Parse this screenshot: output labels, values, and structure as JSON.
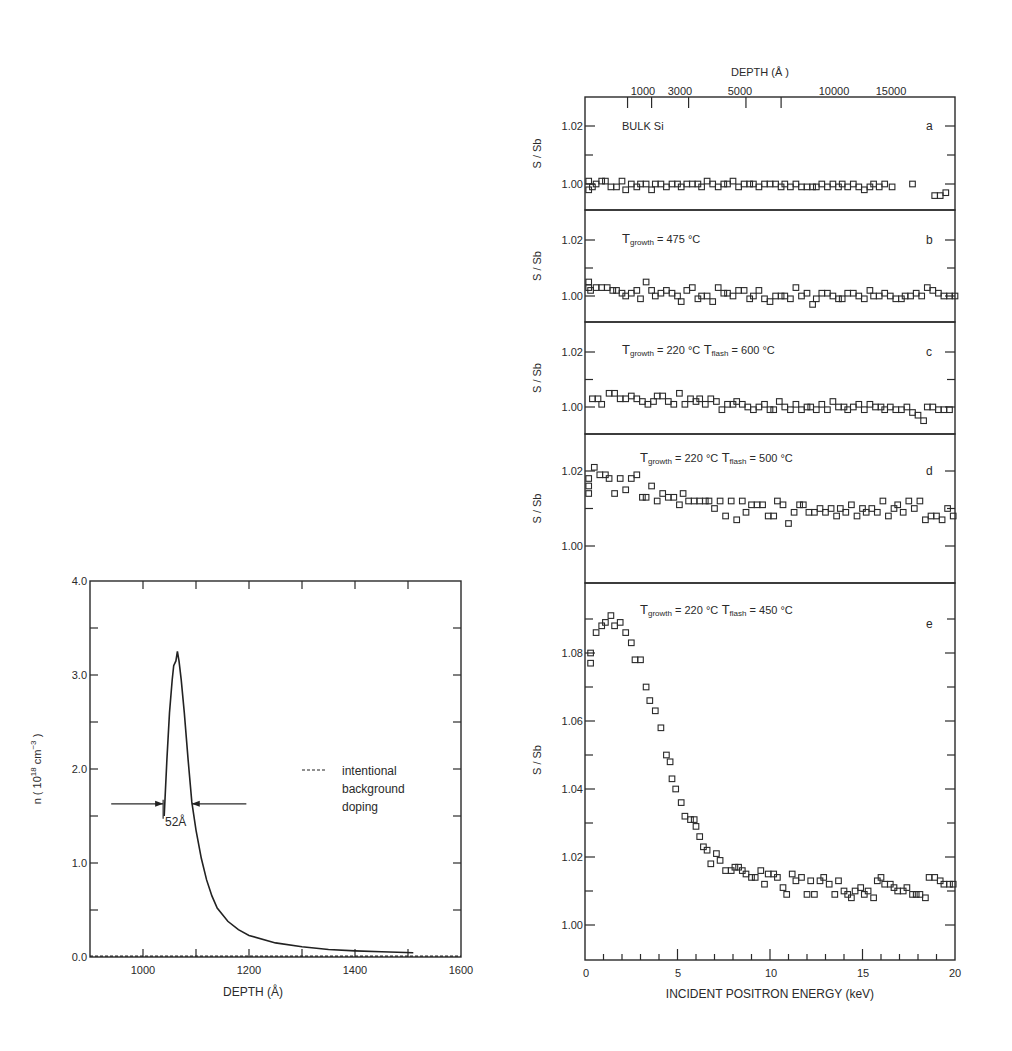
{
  "chart_data": [
    {
      "id": "left",
      "type": "line",
      "title": "",
      "xlabel": "DEPTH (Å)",
      "ylabel": "n ( 10^18 cm^-3 )",
      "xlim": [
        900,
        1600
      ],
      "ylim": [
        0.0,
        4.0
      ],
      "xticks": [
        1000,
        1200,
        1400,
        1600
      ],
      "yticks": [
        "0.0",
        "1.0",
        "2.0",
        "3.0",
        "4.0"
      ],
      "series": [
        {
          "name": "dopant profile",
          "style": "solid",
          "x": [
            1040,
            1045,
            1050,
            1055,
            1058,
            1062,
            1065,
            1068,
            1072,
            1078,
            1085,
            1092,
            1100,
            1110,
            1120,
            1130,
            1140,
            1160,
            1180,
            1200,
            1250,
            1300,
            1350,
            1400,
            1450,
            1510
          ],
          "y": [
            1.5,
            2.1,
            2.6,
            2.95,
            3.1,
            3.15,
            3.25,
            3.15,
            2.95,
            2.6,
            2.1,
            1.65,
            1.35,
            1.05,
            0.82,
            0.65,
            0.52,
            0.38,
            0.29,
            0.23,
            0.15,
            0.11,
            0.08,
            0.065,
            0.055,
            0.045
          ]
        },
        {
          "name": "intentional background doping",
          "style": "dashed",
          "x": [
            900,
            1600
          ],
          "y": [
            0.01,
            0.01
          ]
        }
      ],
      "annotations": {
        "fwhm_label": "52Å",
        "fwhm_left_x": 1038,
        "fwhm_right_x": 1092,
        "fwhm_y": 1.63,
        "arrow_left_start": 940,
        "arrow_right_end": 1195
      },
      "legend": {
        "line1": "intentional",
        "line2": "background",
        "line3": "doping",
        "position": "right-middle"
      }
    },
    {
      "id": "right",
      "type": "scatter",
      "xlabel": "INCIDENT POSITRON ENERGY (keV)",
      "top_xlabel": "DEPTH (Å )",
      "ylabel": "S / Sb",
      "xlim": [
        0,
        20
      ],
      "xticks": [
        "0",
        "5",
        "10",
        "15",
        "20"
      ],
      "top_xticks": [
        {
          "label": "1000",
          "energy": 2.3
        },
        {
          "label": "3000",
          "energy": 3.6
        },
        {
          "label": "5000",
          "energy": 5.6
        },
        {
          "label": "10000",
          "energy": 8.7
        },
        {
          "label": "15000",
          "energy": 10.6
        }
      ],
      "top_tick_labels_text": [
        "1000",
        "3000",
        "5000",
        "10000",
        "15000"
      ],
      "panels": [
        {
          "letter": "a",
          "label": "BULK Si",
          "yticks": [
            "1.02",
            "1.00"
          ],
          "ylim": [
            0.9935,
            1.0295
          ],
          "x": [
            0.2,
            0.2,
            0.4,
            0.6,
            0.9,
            1.1,
            1.4,
            1.7,
            2.0,
            2.2,
            2.5,
            2.8,
            3.0,
            3.3,
            3.6,
            3.8,
            4.1,
            4.4,
            4.7,
            5.0,
            5.2,
            5.5,
            5.8,
            6.1,
            6.3,
            6.6,
            6.9,
            7.2,
            7.5,
            7.7,
            8.0,
            8.3,
            8.6,
            8.9,
            9.1,
            9.4,
            9.7,
            10.0,
            10.3,
            10.6,
            10.8,
            11.1,
            11.4,
            11.7,
            12.0,
            12.3,
            12.5,
            12.8,
            13.1,
            13.4,
            13.7,
            13.9,
            14.2,
            14.5,
            14.8,
            15.1,
            15.4,
            15.6,
            15.9,
            16.2,
            16.6,
            17.7,
            18.9,
            19.2,
            19.5
          ],
          "y": [
            1.001,
            0.998,
            0.999,
            1.0,
            1.001,
            1.001,
            0.999,
            0.999,
            1.001,
            0.998,
            1.0,
            0.999,
            1.0,
            1.0,
            0.998,
            1.0,
            1.0,
            0.999,
            1.0,
            1.0,
            0.999,
            1.0,
            1.0,
            1.0,
            0.999,
            1.001,
            1.0,
            0.999,
            1.0,
            1.0,
            1.001,
            0.999,
            1.0,
            1.0,
            1.0,
            0.999,
            1.0,
            1.0,
            1.0,
            0.999,
            1.0,
            0.999,
            1.0,
            0.999,
            0.999,
            0.999,
            0.999,
            1.0,
            0.999,
            1.0,
            0.999,
            1.0,
            0.999,
            1.0,
            0.999,
            0.998,
            0.999,
            1.0,
            0.999,
            1.0,
            0.999,
            1.0,
            0.996,
            0.996,
            0.997
          ]
        },
        {
          "letter": "b",
          "label": "T_growth = 475 °C",
          "label_parts": {
            "T": "T",
            "sub": "growth",
            "rest": "=  475 °C"
          },
          "yticks": [
            "1.02",
            "1.00"
          ],
          "ylim": [
            0.9935,
            1.0295
          ],
          "x": [
            0.2,
            0.2,
            0.3,
            0.6,
            0.9,
            1.2,
            1.5,
            1.7,
            2.0,
            2.2,
            2.5,
            2.8,
            3.0,
            3.3,
            3.6,
            3.8,
            4.1,
            4.4,
            4.7,
            5.0,
            5.2,
            5.5,
            5.8,
            6.1,
            6.3,
            6.6,
            6.9,
            7.2,
            7.5,
            7.7,
            8.0,
            8.3,
            8.6,
            8.9,
            9.1,
            9.4,
            9.7,
            10.0,
            10.3,
            10.6,
            10.8,
            11.1,
            11.4,
            11.7,
            12.0,
            12.3,
            12.5,
            12.8,
            13.1,
            13.4,
            13.7,
            13.9,
            14.2,
            14.5,
            14.8,
            15.1,
            15.4,
            15.6,
            15.9,
            16.2,
            16.5,
            16.8,
            17.1,
            17.3,
            17.6,
            17.9,
            18.2,
            18.5,
            18.8,
            19.1,
            19.4,
            19.7,
            20.0
          ],
          "y": [
            1.005,
            1.003,
            1.002,
            1.003,
            1.003,
            1.003,
            1.002,
            1.002,
            1.001,
            1.0,
            1.001,
            1.002,
            0.999,
            1.005,
            1.002,
            1.0,
            1.001,
            1.002,
            1.001,
            1.0,
            0.998,
            1.002,
            1.003,
            0.999,
            1.0,
            1.0,
            0.998,
            1.003,
            1.001,
            1.001,
            1.0,
            1.002,
            1.002,
            0.999,
            1.0,
            1.002,
            0.999,
            0.998,
            1.0,
            1.0,
            1.0,
            0.999,
            1.003,
            1.0,
            1.001,
            0.997,
            0.999,
            1.001,
            1.001,
            1.0,
            0.999,
            0.999,
            1.001,
            1.001,
            1.0,
            0.999,
            1.002,
            1.0,
            1.0,
            1.001,
            1.0,
            0.999,
            0.999,
            1.0,
            1.0,
            1.001,
            1.0,
            1.003,
            1.002,
            1.001,
            1.0,
            1.0,
            1.0
          ]
        },
        {
          "letter": "c",
          "label": "T_growth = 220 °C   T_flash = 600 °C",
          "label_parts": {
            "T": "T",
            "sub": "growth",
            "rest": "=  220 °C",
            "T2": "T",
            "sub2": "flash",
            "rest2": "=  600 °C"
          },
          "yticks": [
            "1.02",
            "1.00"
          ],
          "ylim": [
            0.9935,
            1.0295
          ],
          "x": [
            0.4,
            0.7,
            0.9,
            1.3,
            1.6,
            1.9,
            2.2,
            2.5,
            2.8,
            3.1,
            3.4,
            3.7,
            3.9,
            4.2,
            4.5,
            4.8,
            5.1,
            5.4,
            5.7,
            6.0,
            6.2,
            6.5,
            6.8,
            7.1,
            7.4,
            7.7,
            8.0,
            8.2,
            8.5,
            8.8,
            9.1,
            9.4,
            9.7,
            10.0,
            10.2,
            10.5,
            10.8,
            11.1,
            11.4,
            11.7,
            12.0,
            12.2,
            12.5,
            12.8,
            13.1,
            13.4,
            13.7,
            14.0,
            14.2,
            14.5,
            14.8,
            15.1,
            15.4,
            15.7,
            16.0,
            16.2,
            16.5,
            16.8,
            17.1,
            17.4,
            17.7,
            18.0,
            18.3,
            18.5,
            18.8,
            19.1,
            19.4,
            19.7
          ],
          "y": [
            1.003,
            1.003,
            1.001,
            1.005,
            1.005,
            1.003,
            1.003,
            1.004,
            1.003,
            1.002,
            1.001,
            1.002,
            1.004,
            1.004,
            1.002,
            1.001,
            1.005,
            1.001,
            1.003,
            1.002,
            1.003,
            1.001,
            1.003,
            1.002,
            0.999,
            1.001,
            1.001,
            1.002,
            1.001,
            1.0,
            0.999,
            1.0,
            1.001,
            0.999,
            0.999,
            1.002,
            1.0,
            0.999,
            1.001,
            0.999,
            1.0,
            1.0,
            0.999,
            1.001,
            0.999,
            1.002,
            1.0,
            1.0,
            0.999,
            1.0,
            1.001,
            0.999,
            1.001,
            1.0,
            1.0,
            0.999,
            1.0,
            0.999,
            0.999,
            1.0,
            0.998,
            0.997,
            0.995,
            1.0,
            1.0,
            0.999,
            0.999,
            0.999
          ]
        },
        {
          "letter": "d",
          "label": "T_growth = 220 °C   T_flash = 500 °C",
          "label_parts": {
            "T": "T",
            "sub": "growth",
            "rest": "=  220  °C",
            "T2": "T",
            "sub2": "flash",
            "rest2": "=  500 °C"
          },
          "yticks": [
            "1.02",
            "1.00"
          ],
          "ylim": [
            0.9898,
            1.0297
          ],
          "x": [
            0.2,
            0.2,
            0.2,
            0.5,
            0.8,
            1.1,
            1.3,
            1.6,
            1.9,
            2.2,
            2.5,
            2.8,
            3.1,
            3.3,
            3.6,
            3.9,
            4.2,
            4.5,
            4.8,
            5.1,
            5.3,
            5.6,
            5.9,
            6.2,
            6.5,
            6.7,
            7.0,
            7.3,
            7.6,
            7.9,
            8.2,
            8.5,
            8.7,
            9.0,
            9.3,
            9.6,
            9.9,
            10.2,
            10.4,
            10.7,
            11.0,
            11.3,
            11.6,
            11.8,
            12.1,
            12.4,
            12.7,
            13.0,
            13.3,
            13.6,
            13.8,
            14.1,
            14.4,
            14.7,
            15.0,
            15.2,
            15.5,
            15.8,
            16.1,
            16.4,
            16.7,
            16.9,
            17.2,
            17.5,
            17.8,
            18.1,
            18.4,
            18.7,
            19.0,
            19.3,
            19.6,
            19.9
          ],
          "y": [
            1.018,
            1.016,
            1.014,
            1.021,
            1.019,
            1.019,
            1.018,
            1.014,
            1.018,
            1.015,
            1.018,
            1.019,
            1.013,
            1.013,
            1.016,
            1.012,
            1.014,
            1.013,
            1.013,
            1.011,
            1.014,
            1.012,
            1.012,
            1.012,
            1.012,
            1.012,
            1.01,
            1.012,
            1.008,
            1.012,
            1.007,
            1.012,
            1.009,
            1.011,
            1.011,
            1.011,
            1.008,
            1.008,
            1.012,
            1.011,
            1.006,
            1.009,
            1.011,
            1.011,
            1.009,
            1.009,
            1.01,
            1.009,
            1.01,
            1.008,
            1.01,
            1.009,
            1.011,
            1.008,
            1.01,
            1.009,
            1.01,
            1.009,
            1.012,
            1.008,
            1.01,
            1.011,
            1.009,
            1.012,
            1.01,
            1.012,
            1.007,
            1.008,
            1.008,
            1.007,
            1.01,
            1.008
          ]
        },
        {
          "letter": "e",
          "label": "T_growth = 220 °C   T_flash = 450 °C",
          "label_parts": {
            "T": "T",
            "sub": "growth",
            "rest": "=  220  °C",
            "T2": "T",
            "sub2": "flash",
            "rest2": "= 450  °C"
          },
          "yticks": [
            "1.08",
            "1.06",
            "1.04",
            "1.02",
            "1.00"
          ],
          "ylim": [
            0.9895,
            1.1005
          ],
          "x": [
            0.3,
            0.3,
            0.6,
            0.9,
            1.1,
            1.4,
            1.6,
            1.9,
            2.2,
            2.5,
            2.7,
            3.0,
            3.3,
            3.5,
            3.8,
            4.1,
            4.4,
            4.6,
            4.7,
            4.9,
            5.2,
            5.4,
            5.7,
            5.9,
            6.0,
            6.2,
            6.4,
            6.6,
            6.8,
            7.1,
            7.3,
            7.6,
            7.9,
            8.1,
            8.3,
            8.5,
            8.7,
            9.0,
            9.2,
            9.5,
            9.7,
            9.9,
            10.2,
            10.4,
            10.7,
            10.9,
            11.2,
            11.4,
            11.7,
            12.0,
            12.2,
            12.4,
            12.7,
            12.9,
            13.2,
            13.5,
            13.7,
            14.0,
            14.2,
            14.4,
            14.6,
            14.9,
            15.1,
            15.3,
            15.6,
            15.8,
            16.0,
            16.2,
            16.5,
            16.7,
            16.9,
            17.2,
            17.4,
            17.7,
            17.9,
            18.1,
            18.4,
            18.6,
            18.9,
            19.2,
            19.4,
            19.7,
            19.9
          ],
          "y": [
            1.08,
            1.077,
            1.086,
            1.088,
            1.089,
            1.091,
            1.088,
            1.089,
            1.086,
            1.083,
            1.078,
            1.078,
            1.07,
            1.066,
            1.063,
            1.058,
            1.05,
            1.048,
            1.043,
            1.04,
            1.036,
            1.032,
            1.031,
            1.031,
            1.029,
            1.026,
            1.023,
            1.022,
            1.018,
            1.021,
            1.019,
            1.016,
            1.016,
            1.017,
            1.017,
            1.016,
            1.015,
            1.014,
            1.014,
            1.016,
            1.012,
            1.015,
            1.015,
            1.014,
            1.011,
            1.009,
            1.015,
            1.013,
            1.014,
            1.009,
            1.013,
            1.009,
            1.013,
            1.014,
            1.012,
            1.009,
            1.013,
            1.01,
            1.009,
            1.008,
            1.01,
            1.011,
            1.009,
            1.01,
            1.008,
            1.013,
            1.014,
            1.012,
            1.012,
            1.011,
            1.01,
            1.01,
            1.011,
            1.009,
            1.009,
            1.009,
            1.008,
            1.014,
            1.014,
            1.013,
            1.012,
            1.012,
            1.012
          ]
        }
      ]
    }
  ],
  "left": {
    "ylabel_main": "n ( 10",
    "ylabel_exp1": "18",
    "ylabel_mid": " cm",
    "ylabel_exp2": "−3",
    "ylabel_end": " )",
    "xlabel": "DEPTH (Å)",
    "xtick_labels": [
      "1000",
      "1200",
      "1400",
      "1600"
    ],
    "ytick_labels": [
      "0.0",
      "1.0",
      "2.0",
      "3.0",
      "4.0"
    ],
    "fwhm_label": "52Å",
    "legend": [
      "intentional",
      "background",
      "doping"
    ]
  },
  "right": {
    "top_title": "DEPTH (Å )",
    "top_tick_labels": [
      "1000",
      "3000",
      "5000",
      "10000",
      "15000"
    ],
    "xlabel": "INCIDENT POSITRON ENERGY (keV)",
    "xtick_labels": [
      "0",
      "5",
      "10",
      "15",
      "20"
    ],
    "ylabel": "S / Sb",
    "panel_letters": [
      "a",
      "b",
      "c",
      "d",
      "e"
    ],
    "panel_a_label": "BULK Si"
  }
}
